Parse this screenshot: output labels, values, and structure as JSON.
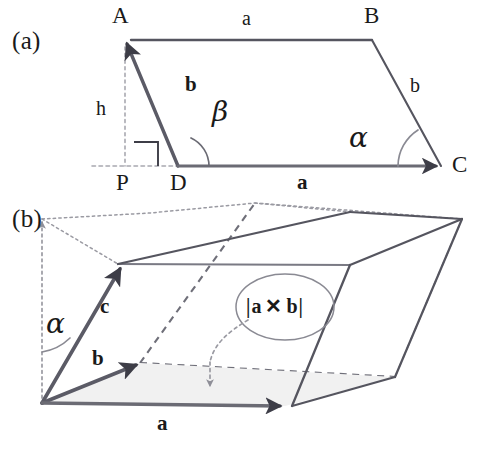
{
  "figure": {
    "background_color": "#ffffff",
    "stroke_color": "#3d3d47",
    "light_stroke_color": "#9a9aa2",
    "fill_shade": "#f2f2f2",
    "text_color": "#1a1a1a"
  },
  "panel_a": {
    "tag": "(a)",
    "vertices": {
      "A": "A",
      "B": "B",
      "C": "C",
      "D": "D",
      "P": "P"
    },
    "labels": {
      "side_top": "a",
      "side_right": "b",
      "vector_b": "b",
      "vector_a": "a",
      "height": "h",
      "angle_beta": "β",
      "angle_alpha": "α"
    },
    "geometry": {
      "A": [
        125,
        40
      ],
      "B": [
        372,
        40
      ],
      "C": [
        441,
        166
      ],
      "D": [
        178,
        166
      ],
      "P": [
        125,
        166
      ]
    }
  },
  "panel_b": {
    "tag": "(b)",
    "labels": {
      "vector_a": "a",
      "vector_b": "b",
      "vector_c": "c",
      "angle_alpha": "α",
      "cross_product": "|a ✕ b|"
    },
    "cross_product_parts": {
      "bar_left": "|",
      "a": "a",
      "times": "✕",
      "b": "b",
      "bar_right": "|"
    },
    "geometry": {
      "origin": [
        42,
        403
      ],
      "a_tip": [
        285,
        406
      ],
      "b_tip": [
        140,
        363
      ],
      "c_tip": [
        118,
        264
      ],
      "top_right": [
        462,
        219
      ]
    }
  }
}
